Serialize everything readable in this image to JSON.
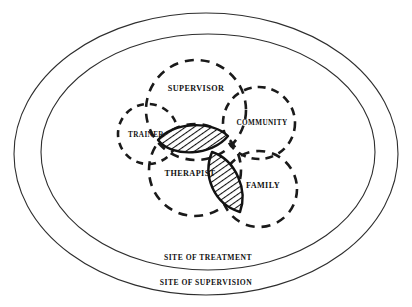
{
  "diagram": {
    "background_color": "#ffffff",
    "line_color": "#1a1a1a",
    "frame_color": "#2e2e2e",
    "hatch_color": "#121212",
    "frames": [
      {
        "id": "site-of-supervision",
        "label": "SITE OF SUPERVISION",
        "cx": 206,
        "cy": 154,
        "rx": 192,
        "ry": 141,
        "label_x": 206,
        "label_y": 283,
        "font_size": 7.6
      },
      {
        "id": "site-of-treatment",
        "label": "SITE OF TREATMENT",
        "cx": 208,
        "cy": 152,
        "rx": 167,
        "ry": 118,
        "label_x": 208,
        "label_y": 258,
        "font_size": 7.6
      }
    ],
    "sets": [
      {
        "id": "supervisor",
        "label": "SUPERVISOR",
        "cx": 196,
        "cy": 110,
        "r": 50,
        "label_x": 196,
        "label_y": 89,
        "font_size": 8.2,
        "dash": "9 7"
      },
      {
        "id": "trainer",
        "label": "TRAINER",
        "cx": 148,
        "cy": 134,
        "r": 30,
        "label_x": 146,
        "label_y": 135,
        "font_size": 7.2,
        "dash": "7 6"
      },
      {
        "id": "community",
        "label": "COMMUNITY",
        "cx": 259,
        "cy": 123,
        "r": 36,
        "label_x": 262,
        "label_y": 123,
        "font_size": 7.2,
        "dash": "8 6"
      },
      {
        "id": "therapist",
        "label": "THERAPIST",
        "cx": 195,
        "cy": 170,
        "r": 46,
        "label_x": 190,
        "label_y": 174,
        "font_size": 8.2,
        "dash": "9 7"
      },
      {
        "id": "family",
        "label": "FAMILY",
        "cx": 259,
        "cy": 189,
        "r": 38,
        "label_x": 263,
        "label_y": 186,
        "font_size": 8.2,
        "dash": "9 7"
      }
    ],
    "intersections": [
      {
        "id": "upper-lens",
        "description": "hatched overlap of SUPERVISOR and THERAPIST",
        "path": "M 158 140 C 172 122 212 120 228 136 C 212 156 172 158 158 140 Z"
      },
      {
        "id": "lower-lens",
        "description": "hatched overlap of THERAPIST and FAMILY",
        "path": "M 212 152 C 236 160 248 190 240 212 C 214 204 202 176 212 152 Z"
      }
    ]
  }
}
